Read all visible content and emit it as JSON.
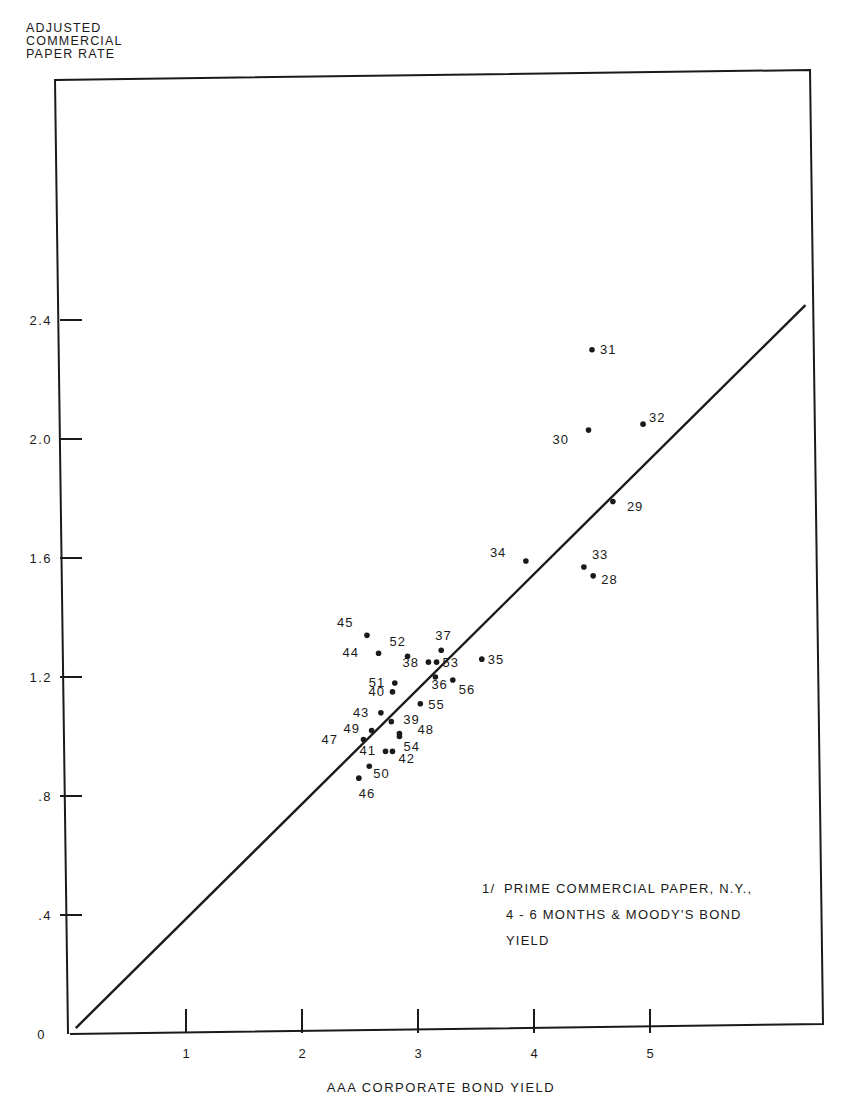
{
  "chart_data": {
    "type": "scatter",
    "title": "",
    "ylabel_lines": [
      "ADJUSTED",
      "COMMERCIAL",
      "PAPER RATE"
    ],
    "ylabel": "ADJUSTED COMMERCIAL PAPER RATE",
    "xlabel": "AAA CORPORATE BOND YIELD",
    "xlim": [
      0,
      6.4
    ],
    "ylim": [
      0,
      2.4
    ],
    "grid": false,
    "x_ticks": [
      1,
      2,
      3,
      4,
      5
    ],
    "x_tick_labels": [
      "1",
      "2",
      "3",
      "4",
      "5"
    ],
    "y_ticks": [
      0,
      0.4,
      0.8,
      1.2,
      1.6,
      2.0,
      2.4
    ],
    "y_tick_labels": [
      "0",
      ".4",
      ".8",
      "1.2",
      "1.6",
      "2.0",
      "2.4"
    ],
    "note": {
      "mark": "1/",
      "lines": [
        "PRIME COMMERCIAL PAPER, N.Y.,",
        "4 - 6 MONTHS & MOODY'S BOND",
        "YIELD"
      ]
    },
    "fit_line": {
      "x": [
        0.05,
        6.34
      ],
      "y": [
        0.02,
        2.45
      ],
      "style": "solid"
    },
    "points": [
      {
        "label": "28",
        "x": 4.51,
        "y": 1.54,
        "lx": 8,
        "ly": 8
      },
      {
        "label": "29",
        "x": 4.68,
        "y": 1.79,
        "lx": 14,
        "ly": 10
      },
      {
        "label": "30",
        "x": 4.47,
        "y": 2.03,
        "lx": -36,
        "ly": 14
      },
      {
        "label": "31",
        "x": 4.5,
        "y": 2.3,
        "lx": 8,
        "ly": 4
      },
      {
        "label": "32",
        "x": 4.94,
        "y": 2.05,
        "lx": 6,
        "ly": -2
      },
      {
        "label": "33",
        "x": 4.43,
        "y": 1.57,
        "lx": 8,
        "ly": -8
      },
      {
        "label": "34",
        "x": 3.93,
        "y": 1.59,
        "lx": -36,
        "ly": -4
      },
      {
        "label": "35",
        "x": 3.55,
        "y": 1.26,
        "lx": 6,
        "ly": 5
      },
      {
        "label": "36",
        "x": 3.15,
        "y": 1.2,
        "lx": -4,
        "ly": 12
      },
      {
        "label": "37",
        "x": 3.2,
        "y": 1.29,
        "lx": -6,
        "ly": -10
      },
      {
        "label": "38",
        "x": 3.09,
        "y": 1.25,
        "lx": -26,
        "ly": 5
      },
      {
        "label": "39",
        "x": 2.77,
        "y": 1.05,
        "lx": 12,
        "ly": 2
      },
      {
        "label": "40",
        "x": 2.78,
        "y": 1.15,
        "lx": -24,
        "ly": 4
      },
      {
        "label": "41",
        "x": 2.72,
        "y": 0.95,
        "lx": -26,
        "ly": 4
      },
      {
        "label": "42",
        "x": 2.78,
        "y": 0.95,
        "lx": 6,
        "ly": 12
      },
      {
        "label": "43",
        "x": 2.68,
        "y": 1.08,
        "lx": -28,
        "ly": 4
      },
      {
        "label": "44",
        "x": 2.66,
        "y": 1.28,
        "lx": -36,
        "ly": 4
      },
      {
        "label": "45",
        "x": 2.56,
        "y": 1.34,
        "lx": -30,
        "ly": -8
      },
      {
        "label": "46",
        "x": 2.49,
        "y": 0.86,
        "lx": 0,
        "ly": 20
      },
      {
        "label": "47",
        "x": 2.53,
        "y": 0.99,
        "lx": -42,
        "ly": 5
      },
      {
        "label": "48",
        "x": 2.84,
        "y": 1.01,
        "lx": 18,
        "ly": 0
      },
      {
        "label": "49",
        "x": 2.6,
        "y": 1.02,
        "lx": -28,
        "ly": 2
      },
      {
        "label": "50",
        "x": 2.58,
        "y": 0.9,
        "lx": 4,
        "ly": 12
      },
      {
        "label": "51",
        "x": 2.8,
        "y": 1.18,
        "lx": -26,
        "ly": 4
      },
      {
        "label": "52",
        "x": 2.91,
        "y": 1.27,
        "lx": -18,
        "ly": -10
      },
      {
        "label": "53",
        "x": 3.16,
        "y": 1.25,
        "lx": 6,
        "ly": 5
      },
      {
        "label": "54",
        "x": 2.84,
        "y": 1.0,
        "lx": 4,
        "ly": 14
      },
      {
        "label": "55",
        "x": 3.02,
        "y": 1.11,
        "lx": 8,
        "ly": 5
      },
      {
        "label": "56",
        "x": 3.3,
        "y": 1.19,
        "lx": 6,
        "ly": 14
      }
    ]
  },
  "frame": {
    "stroke": "#1a1a1a",
    "background": "#ffffff"
  }
}
